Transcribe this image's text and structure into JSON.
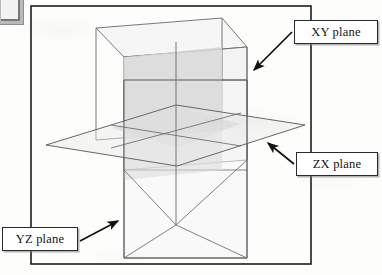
{
  "figure": {
    "frame": {
      "name": "figure-border",
      "stroke": "#1d1d1d",
      "x": 31,
      "y": 6,
      "width": 280,
      "height": 258
    },
    "background_color": "#fdfdfc",
    "plane_fill_light": "#f3f3f3",
    "plane_fill_mid": "#dcdcdc",
    "plane_stroke": "#5a5a5a",
    "callout_border": "#2b2b2b",
    "callout_fill": "#ffffff",
    "arrow_color": "#111111"
  },
  "labels": {
    "xy": "XY plane",
    "zx": "ZX plane",
    "yz": "YZ plane"
  },
  "planes": [
    {
      "id": "xy-plane",
      "label": "XY plane",
      "orientation": "vertical-right",
      "description": "Rear vertical parallelogram receding to upper-right",
      "points": "96,28 222,18 247,48 247,160 124,170 96,140"
    },
    {
      "id": "zx-plane",
      "label": "ZX plane",
      "orientation": "horizontal",
      "description": "Horizontal parallelogram (ground plane)",
      "points": "46,145 176,105 305,125 177,166"
    },
    {
      "id": "yz-plane",
      "label": "YZ plane",
      "orientation": "vertical-front",
      "description": "Front vertical parallelogram facing viewer",
      "points": "124,80 247,80 247,258 124,258"
    }
  ],
  "arrows": [
    {
      "id": "arrow-xy",
      "from_label": "XY plane",
      "x1": 292,
      "y1": 32,
      "x2": 252,
      "y2": 72
    },
    {
      "id": "arrow-zx",
      "from_label": "ZX plane",
      "x1": 294,
      "y1": 164,
      "x2": 266,
      "y2": 143
    },
    {
      "id": "arrow-yz",
      "from_label": "YZ plane",
      "x1": 80,
      "y1": 240,
      "x2": 118,
      "y2": 221
    }
  ]
}
